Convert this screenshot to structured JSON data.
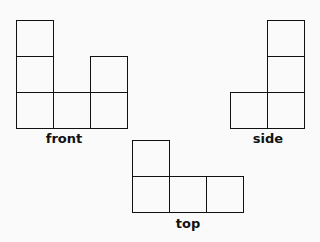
{
  "views": {
    "front": {
      "label": "front",
      "cells": [
        [
          0,
          0
        ],
        [
          0,
          1
        ],
        [
          0,
          2
        ],
        [
          1,
          2
        ],
        [
          2,
          1
        ],
        [
          2,
          2
        ]
      ]
    },
    "side": {
      "label": "side",
      "cells": [
        [
          1,
          0
        ],
        [
          1,
          1
        ],
        [
          1,
          2
        ],
        [
          0,
          2
        ]
      ]
    },
    "top": {
      "label": "top",
      "cells": [
        [
          0,
          0
        ],
        [
          0,
          1
        ],
        [
          1,
          1
        ],
        [
          2,
          1
        ]
      ]
    }
  }
}
